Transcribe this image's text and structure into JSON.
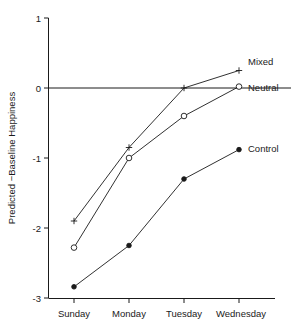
{
  "chart_data": {
    "type": "line",
    "title": "",
    "xlabel": "",
    "ylabel": "Predicted −Baseline Happiness",
    "categories": [
      "Sunday",
      "Monday",
      "Tuesday",
      "Wednesday"
    ],
    "ylim": [
      -3,
      1
    ],
    "ytick_labels": [
      "1",
      "0",
      "-1",
      "-2",
      "-3"
    ],
    "ytick_values": [
      1,
      0,
      -1,
      -2,
      -3
    ],
    "grid": false,
    "legend_position": "inline-right-of-last-point",
    "zero_reference_line": true,
    "series": [
      {
        "name": "Mixed",
        "marker": "plus",
        "values": [
          -1.9,
          -0.85,
          0.0,
          0.25
        ]
      },
      {
        "name": "Neutral",
        "marker": "open-circle",
        "values": [
          -2.28,
          -1.0,
          -0.4,
          0.02
        ]
      },
      {
        "name": "Control",
        "marker": "filled-circle",
        "values": [
          -2.84,
          -2.25,
          -1.3,
          -0.88
        ]
      }
    ]
  },
  "axes": {
    "y_tick_1": "1",
    "y_tick_0": "0",
    "y_tick_m1": "-1",
    "y_tick_m2": "-2",
    "y_tick_m3": "-3",
    "y_axis_title": "Predicted −Baseline Happiness",
    "x_cat_0": "Sunday",
    "x_cat_1": "Monday",
    "x_cat_2": "Tuesday",
    "x_cat_3": "Wednesday"
  },
  "legend": {
    "mixed": "Mixed",
    "neutral": "Neutral",
    "control": "Control"
  },
  "colors": {
    "ink": "#1a1a1a",
    "background": "#ffffff"
  }
}
